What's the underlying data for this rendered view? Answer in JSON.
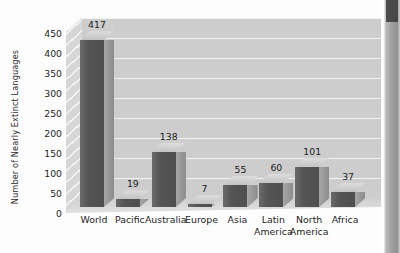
{
  "chart_data": {
    "type": "bar",
    "title": "",
    "subtitle": "",
    "xlabel": "",
    "ylabel": "Number of Nearly Extinct Languages",
    "categories": [
      "World",
      "Pacific",
      "Australia",
      "Europe",
      "Asia",
      "Latin America",
      "North America",
      "Africa"
    ],
    "values": [
      417,
      19,
      138,
      7,
      55,
      60,
      101,
      37
    ],
    "ylim": [
      0,
      450
    ],
    "ytick_labels": [
      "0",
      "50",
      "100",
      "150",
      "200",
      "250",
      "300",
      "350",
      "400",
      "450"
    ],
    "ytick_values": [
      0,
      50,
      100,
      150,
      200,
      250,
      300,
      350,
      400,
      450
    ],
    "grid": true,
    "legend": false,
    "legend_position": "none",
    "style": "3d-bar",
    "colors": {
      "bar_front": "#555555",
      "bar_side": "#9a9a9a",
      "bar_top": "#cfcfcf",
      "plot_background": "#cdcdcd",
      "gridline": "#f2f2f2",
      "page_background": "#fdfdfd",
      "text": "#1d1d1d"
    }
  },
  "artifacts": {
    "scan_edge_label": "page-scan-edge"
  }
}
